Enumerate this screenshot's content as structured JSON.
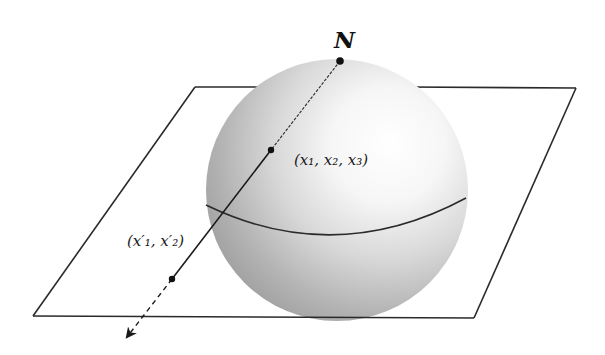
{
  "figure": {
    "labels": {
      "north_pole": "N",
      "sphere_point": "(x₁, x₂, x₃)",
      "plane_point": "(x′₁, x′₂)"
    },
    "colors": {
      "line": "#1a1a1a",
      "sphere_light": "#ffffff",
      "sphere_mid": "#d9d9d9",
      "sphere_dark": "#9a9a9a",
      "background": "#ffffff"
    }
  }
}
